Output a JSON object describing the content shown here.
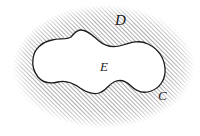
{
  "figure": {
    "type": "math-region-diagram",
    "background_color": "#ffffff",
    "labels": [
      {
        "id": "D",
        "text": "D",
        "meaning": "outer hatched region",
        "x": 122,
        "y": 21
      },
      {
        "id": "E",
        "text": "E",
        "meaning": "inner unhatched region",
        "x": 105,
        "y": 67
      },
      {
        "id": "C",
        "text": "C",
        "meaning": "boundary curve of inner region",
        "x": 163,
        "y": 96
      }
    ],
    "hatching": {
      "angle_degrees": 45,
      "direction": "lower-left to upper-right",
      "spacing_px": 3,
      "line_width_px": 0.9,
      "color": "#5a5a5a"
    },
    "curve": {
      "stroke_color": "#1a1a1a",
      "stroke_width_px": 1.3,
      "fill_color": "#ffffff"
    },
    "outer_boundary": {
      "edge_style": "soft-feathered",
      "stroke": "none"
    }
  }
}
